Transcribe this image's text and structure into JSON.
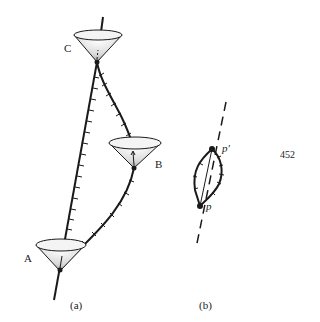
{
  "figure_a": {
    "caption": "(a)",
    "cones": [
      {
        "id": "C",
        "label": "C"
      },
      {
        "id": "B",
        "label": "B"
      },
      {
        "id": "A",
        "label": "A"
      }
    ]
  },
  "figure_b": {
    "caption": "(b)",
    "points": [
      {
        "id": "p_prime",
        "label": "p′"
      },
      {
        "id": "p",
        "label": "p"
      }
    ]
  },
  "page_number": "452",
  "colors": {
    "ink": "#1a1a1a",
    "background": "#ffffff"
  }
}
